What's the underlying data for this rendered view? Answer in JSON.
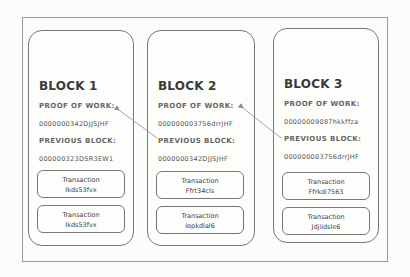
{
  "blocks": [
    {
      "title": "BLOCK 1",
      "proof_label": "PROOF OF WORK:",
      "proof_value": "0000000342DJJSJHF",
      "prev_label": "PREVIOUS BLOCK:",
      "prev_value": "000000323DSR3EW1",
      "transactions": [
        {
          "label": "Transaction",
          "id": "Ikds53fvx"
        },
        {
          "label": "Transaction",
          "id": "Ikds53fvx"
        }
      ]
    },
    {
      "title": "BLOCK 2",
      "proof_label": "PROOF OF WORK:",
      "proof_value": "000000003756drrJHF",
      "prev_label": "PREVIOUS BLOCK:",
      "prev_value": "0000000342DJJSJHF",
      "transactions": [
        {
          "label": "Transaction",
          "id": "Ffrt34cls"
        },
        {
          "label": "Transaction",
          "id": "Iopkdlal6"
        }
      ]
    },
    {
      "title": "BLOCK 3",
      "proof_label": "PROOF OF WORK:",
      "proof_value": "00000009087hkkffza",
      "prev_label": "PREVIOUS BLOCK:",
      "prev_value": "000000003756drrJHF",
      "transactions": [
        {
          "label": "Transaction",
          "id": "Ffrkdi7563"
        },
        {
          "label": "Transaction",
          "id": "Jdjiidsle6"
        }
      ]
    }
  ],
  "arrows": [
    {
      "from": "block-2-previous",
      "to": "block-1-proof"
    },
    {
      "from": "block-3-previous",
      "to": "block-2-proof"
    }
  ],
  "colors": {
    "border": "#777777",
    "text": "#4a4a4a",
    "background": "#fbfbfa"
  }
}
